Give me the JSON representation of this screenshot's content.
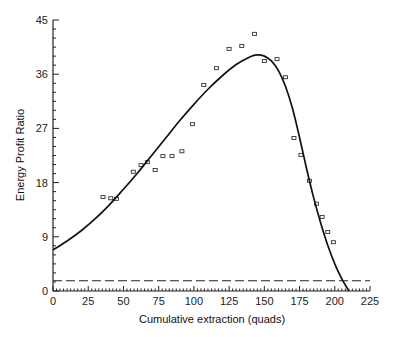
{
  "chart_data": {
    "type": "scatter",
    "title": "",
    "xlabel": "Cumulative extraction (quads)",
    "ylabel": "Energy Profit Ratio",
    "xlim": [
      0,
      225
    ],
    "ylim": [
      0,
      45
    ],
    "x_ticks": [
      0,
      25,
      50,
      75,
      100,
      125,
      150,
      175,
      200,
      225
    ],
    "y_ticks": [
      0,
      9,
      18,
      27,
      36,
      45
    ],
    "grid": false,
    "legend": null,
    "series": [
      {
        "name": "Observed",
        "kind": "scatter",
        "marker": "open-square",
        "points": [
          [
            35.5,
            15.6
          ],
          [
            41,
            15.4
          ],
          [
            45,
            15.3
          ],
          [
            57,
            19.8
          ],
          [
            62.5,
            20.9
          ],
          [
            67,
            21.4
          ],
          [
            72.5,
            20.1
          ],
          [
            78,
            22.4
          ],
          [
            84.5,
            22.4
          ],
          [
            91.5,
            23.2
          ],
          [
            99,
            27.7
          ],
          [
            107,
            34.2
          ],
          [
            116,
            37.0
          ],
          [
            125,
            40.2
          ],
          [
            134,
            40.7
          ],
          [
            143,
            42.7
          ],
          [
            150,
            38.2
          ],
          [
            159,
            38.5
          ],
          [
            165,
            35.5
          ],
          [
            171,
            25.4
          ],
          [
            176,
            22.6
          ],
          [
            182,
            18.3
          ],
          [
            187,
            14.5
          ],
          [
            191,
            12.3
          ],
          [
            195,
            9.8
          ],
          [
            199,
            8.1
          ]
        ]
      },
      {
        "name": "Fitted curve",
        "kind": "line",
        "style": "solid",
        "points": [
          [
            0,
            6.8
          ],
          [
            10,
            8.3
          ],
          [
            20,
            10.0
          ],
          [
            30,
            12.0
          ],
          [
            40,
            14.3
          ],
          [
            50,
            16.9
          ],
          [
            60,
            19.6
          ],
          [
            70,
            22.5
          ],
          [
            80,
            25.4
          ],
          [
            90,
            28.3
          ],
          [
            100,
            31.0
          ],
          [
            110,
            33.5
          ],
          [
            120,
            35.7
          ],
          [
            130,
            37.6
          ],
          [
            140,
            38.9
          ],
          [
            145,
            39.2
          ],
          [
            150,
            39.0
          ],
          [
            155,
            38.2
          ],
          [
            160,
            36.6
          ],
          [
            165,
            34.0
          ],
          [
            170,
            30.3
          ],
          [
            175,
            25.5
          ],
          [
            180,
            20.3
          ],
          [
            185,
            15.5
          ],
          [
            190,
            11.3
          ],
          [
            195,
            7.6
          ],
          [
            200,
            4.5
          ],
          [
            205,
            2.0
          ],
          [
            210,
            0
          ]
        ]
      },
      {
        "name": "Breakeven",
        "kind": "line",
        "style": "dashed",
        "points": [
          [
            0,
            1.7
          ],
          [
            225,
            1.7
          ]
        ]
      }
    ]
  }
}
